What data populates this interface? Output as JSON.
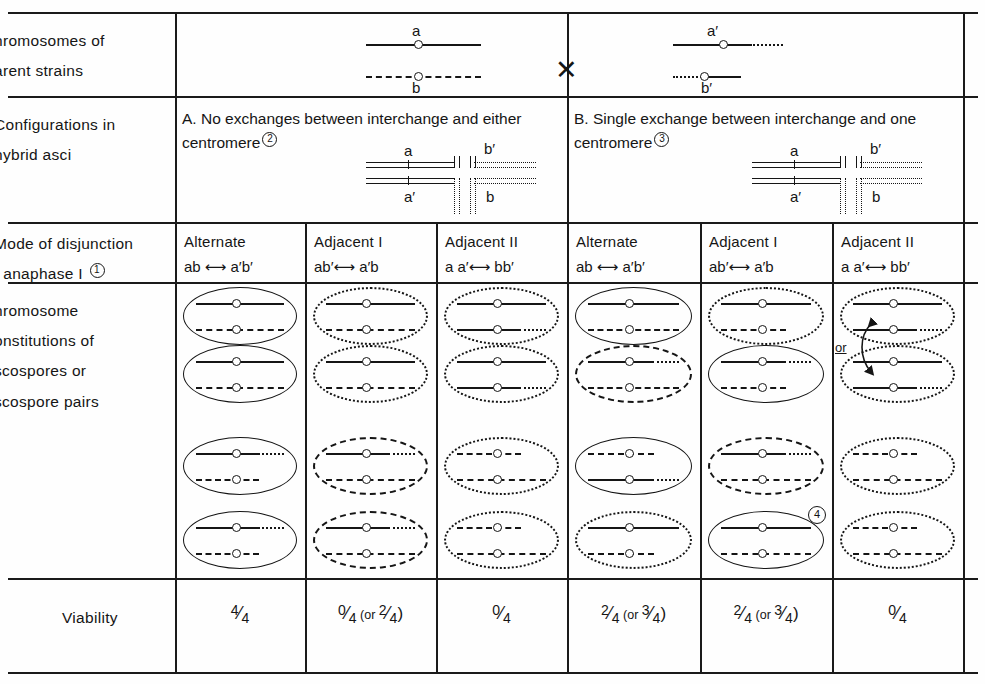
{
  "figure": {
    "kind": "genetics-table",
    "row_labels": [
      "hromosomes of\narent strains",
      "Configurations in\nhybrid asci",
      "Mode of disjunction\nt  anaphase I",
      "hromosome\nonstitutions of\nscospores or\nscospore pairs",
      "Viability"
    ],
    "row_label_footnotes": {
      "disjunction": "1"
    }
  },
  "parents": {
    "left": {
      "top_allele": "a",
      "bottom_allele": "b"
    },
    "cross_symbol": "✕",
    "right": {
      "top_allele": "a′",
      "bottom_allele": "b′"
    }
  },
  "sections": [
    {
      "id": "A",
      "title": "A. No exchanges between interchange and either centromere",
      "footnote": "2",
      "config_labels": {
        "tl": "a",
        "bl": "a′",
        "tr": "b′",
        "br": "b"
      }
    },
    {
      "id": "B",
      "title": "B. Single exchange between interchange and one centromere",
      "footnote": "3",
      "config_labels": {
        "tl": "a",
        "bl": "a′",
        "tr": "b′",
        "br": "b"
      }
    }
  ],
  "columns": [
    {
      "mode": "Alternate",
      "gametes": "ab ⟷ a′b′",
      "viability": "4/4",
      "section": "A"
    },
    {
      "mode": "Adjacent I",
      "gametes": "ab′⟷ a′b",
      "viability": "0/4 (or 2/4)",
      "section": "A"
    },
    {
      "mode": "Adjacent II",
      "gametes": "a a′⟷ bb′",
      "viability": "0/4",
      "section": "A"
    },
    {
      "mode": "Alternate",
      "gametes": "ab ⟷ a′b′",
      "viability": "2/4 (or 3/4)",
      "section": "B"
    },
    {
      "mode": "Adjacent I",
      "gametes": "ab′⟷ a′b",
      "viability": "2/4 (or 3/4)",
      "section": "B"
    },
    {
      "mode": "Adjacent II",
      "gametes": "a a′⟷ bb′",
      "viability": "0/4",
      "section": "B"
    }
  ],
  "viability_row_label": "Viability",
  "annotations": {
    "or_label": "or",
    "cell_footnote": "4",
    "cell_footnote_column": "Adjacent I (B)"
  },
  "chart_data": {
    "type": "table",
    "categories": [
      "Alternate (A)",
      "Adjacent I (A)",
      "Adjacent II (A)",
      "Alternate (B)",
      "Adjacent I (B)",
      "Adjacent II (B)"
    ],
    "series": [
      {
        "name": "Viability",
        "values": [
          "4/4",
          "0/4 (or 2/4)",
          "0/4",
          "2/4 (or 3/4)",
          "2/4 (or 3/4)",
          "0/4"
        ]
      }
    ],
    "ascospore_cells": [
      {
        "column": "Alternate (A)",
        "rows": [
          {
            "ellipse": "solid",
            "top": "solid",
            "bottom": "dashed"
          },
          {
            "ellipse": "solid",
            "top": "solid",
            "bottom": "dashed"
          },
          {
            "ellipse": "solid",
            "top": "solid-dotted",
            "bottom": "dashed-short"
          },
          {
            "ellipse": "solid",
            "top": "solid-dotted",
            "bottom": "dashed-short"
          }
        ]
      },
      {
        "column": "Adjacent I (A)",
        "rows": [
          {
            "ellipse": "dotted",
            "top": "solid",
            "bottom": "dashed"
          },
          {
            "ellipse": "dotted",
            "top": "solid",
            "bottom": "dashed"
          },
          {
            "ellipse": "dashed",
            "top": "solid-dotted",
            "bottom": "dashed"
          },
          {
            "ellipse": "dashed",
            "top": "solid-dotted",
            "bottom": "dashed"
          }
        ]
      },
      {
        "column": "Adjacent II (A)",
        "rows": [
          {
            "ellipse": "dotted",
            "top": "solid",
            "bottom": "solid-dotted"
          },
          {
            "ellipse": "dotted",
            "top": "solid",
            "bottom": "solid-dotted"
          },
          {
            "ellipse": "dotted",
            "top": "dashed-short",
            "bottom": "dashed"
          },
          {
            "ellipse": "dotted",
            "top": "dashed-short",
            "bottom": "dashed"
          }
        ]
      },
      {
        "column": "Alternate (B)",
        "rows": [
          {
            "ellipse": "solid",
            "top": "solid",
            "bottom": "dashed"
          },
          {
            "ellipse": "dashed",
            "top": "solid-dotted",
            "bottom": "dashed"
          },
          {
            "ellipse": "solid",
            "top": "dashed-short",
            "bottom": "solid-dotted"
          },
          {
            "ellipse": "dotted",
            "top": "solid",
            "bottom": "dashed-short"
          }
        ]
      },
      {
        "column": "Adjacent I (B)",
        "rows": [
          {
            "ellipse": "dotted",
            "top": "solid",
            "bottom": "dashed-short"
          },
          {
            "ellipse": "solid",
            "top": "solid-dotted",
            "bottom": "dashed-short"
          },
          {
            "ellipse": "dashed",
            "top": "solid-dotted",
            "bottom": "dashed"
          },
          {
            "ellipse": "solid",
            "top": "solid",
            "bottom": "dashed"
          }
        ]
      },
      {
        "column": "Adjacent II (B)",
        "rows": [
          {
            "ellipse": "dotted",
            "top": "solid",
            "bottom": "solid-dotted"
          },
          {
            "ellipse": "dotted",
            "top": "solid",
            "bottom": "solid-dotted"
          },
          {
            "ellipse": "dotted",
            "top": "dashed-short",
            "bottom": "dashed"
          },
          {
            "ellipse": "dotted",
            "top": "dashed-short",
            "bottom": "dashed"
          }
        ]
      }
    ]
  }
}
